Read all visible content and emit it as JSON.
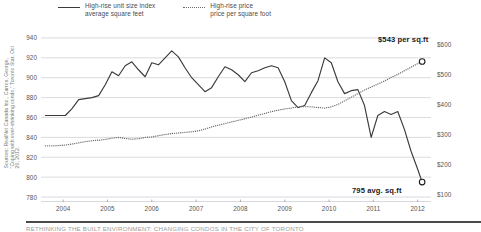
{
  "legend": {
    "entries": [
      {
        "style": "solid",
        "line1": "High-rise unit size index",
        "line2": "average square feet"
      },
      {
        "style": "dotted",
        "line1": "High-rise price",
        "line2": "price per square foot"
      }
    ]
  },
  "source": "Sources: RealNet Canada Inc., Carros, George, \"Coping with ever-shrinking condo,\" Toronto Star, Oct 20, 2012.",
  "footer": "RETHINKING THE BUILT ENVIRONMENT: CHANGING CONDOS IN THE CITY OF TORONTO",
  "annotations": [
    {
      "id": "price",
      "label": "$543 per sq.ft",
      "value": 543,
      "axis": "right"
    },
    {
      "id": "size",
      "label": "795 avg. sq.ft",
      "value": 795,
      "axis": "left"
    }
  ],
  "chart_data": {
    "type": "line",
    "title": "",
    "xlabel": "",
    "ylabel": "average square feet",
    "y2label": "price per square foot",
    "grid": true,
    "legend_position": "top",
    "xlim": [
      2003.5,
      2012.3
    ],
    "ylim": [
      775,
      948
    ],
    "y2lim": [
      75,
      648
    ],
    "yticks": [
      940,
      920,
      900,
      880,
      860,
      840,
      820,
      800,
      780
    ],
    "ytick_labels": [
      "940",
      "920",
      "900",
      "880",
      "860",
      "840",
      "820",
      "800",
      "780"
    ],
    "y2ticks": [
      600,
      500,
      400,
      300,
      200,
      100
    ],
    "y2tick_labels": [
      "$600",
      "$500",
      "$400",
      "$300",
      "$200",
      "$100"
    ],
    "xticks": [
      2004,
      2005,
      2006,
      2007,
      2008,
      2009,
      2010,
      2011,
      2012
    ],
    "xtick_labels": [
      "2004",
      "2005",
      "2006",
      "2007",
      "2008",
      "2009",
      "2010",
      "2011",
      "2012"
    ],
    "series": [
      {
        "name": "High-rise unit size index average square feet",
        "style": "solid",
        "color": "#3b3b3b",
        "axis": "left",
        "x": [
          2003.6,
          2003.75,
          2003.9,
          2004.05,
          2004.2,
          2004.35,
          2004.5,
          2004.65,
          2004.8,
          2004.95,
          2005.1,
          2005.25,
          2005.4,
          2005.55,
          2005.7,
          2005.85,
          2006.0,
          2006.15,
          2006.3,
          2006.45,
          2006.6,
          2006.75,
          2006.9,
          2007.05,
          2007.2,
          2007.35,
          2007.5,
          2007.65,
          2007.8,
          2007.95,
          2008.1,
          2008.25,
          2008.4,
          2008.55,
          2008.7,
          2008.85,
          2009.0,
          2009.15,
          2009.3,
          2009.45,
          2009.6,
          2009.75,
          2009.9,
          2010.05,
          2010.2,
          2010.35,
          2010.5,
          2010.65,
          2010.8,
          2010.95,
          2011.1,
          2011.25,
          2011.4,
          2011.55,
          2011.7,
          2011.85,
          2012.0,
          2012.1
        ],
        "y": [
          862,
          862,
          862,
          862,
          869,
          878,
          879,
          880,
          882,
          893,
          906,
          902,
          912,
          916,
          908,
          901,
          915,
          913,
          920,
          927,
          921,
          910,
          900,
          893,
          886,
          890,
          901,
          911,
          908,
          903,
          896,
          905,
          907,
          910,
          912,
          910,
          896,
          877,
          870,
          872,
          885,
          897,
          920,
          915,
          896,
          884,
          887,
          888,
          872,
          840,
          862,
          866,
          863,
          866,
          848,
          826,
          808,
          795
        ]
      },
      {
        "name": "High-rise price price per square foot",
        "style": "dotted",
        "color": "#6b6b6b",
        "axis": "right",
        "x": [
          2003.6,
          2003.75,
          2003.9,
          2004.05,
          2004.2,
          2004.35,
          2004.5,
          2004.65,
          2004.8,
          2004.95,
          2005.1,
          2005.25,
          2005.4,
          2005.55,
          2005.7,
          2005.85,
          2006.0,
          2006.15,
          2006.3,
          2006.45,
          2006.6,
          2006.75,
          2006.9,
          2007.05,
          2007.2,
          2007.35,
          2007.5,
          2007.65,
          2007.8,
          2007.95,
          2008.1,
          2008.25,
          2008.4,
          2008.55,
          2008.7,
          2008.85,
          2009.0,
          2009.15,
          2009.3,
          2009.45,
          2009.6,
          2009.75,
          2009.9,
          2010.05,
          2010.2,
          2010.35,
          2010.5,
          2010.65,
          2010.8,
          2010.95,
          2011.1,
          2011.25,
          2011.4,
          2011.55,
          2011.7,
          2011.85,
          2012.0,
          2012.1
        ],
        "y": [
          262,
          262,
          263,
          265,
          268,
          272,
          276,
          279,
          281,
          283,
          288,
          290,
          287,
          284,
          286,
          290,
          292,
          296,
          300,
          303,
          305,
          307,
          309,
          312,
          318,
          325,
          331,
          336,
          342,
          347,
          352,
          358,
          364,
          370,
          376,
          381,
          385,
          388,
          392,
          393,
          392,
          390,
          388,
          392,
          400,
          412,
          424,
          436,
          448,
          458,
          468,
          478,
          490,
          500,
          512,
          524,
          536,
          543
        ]
      }
    ]
  }
}
